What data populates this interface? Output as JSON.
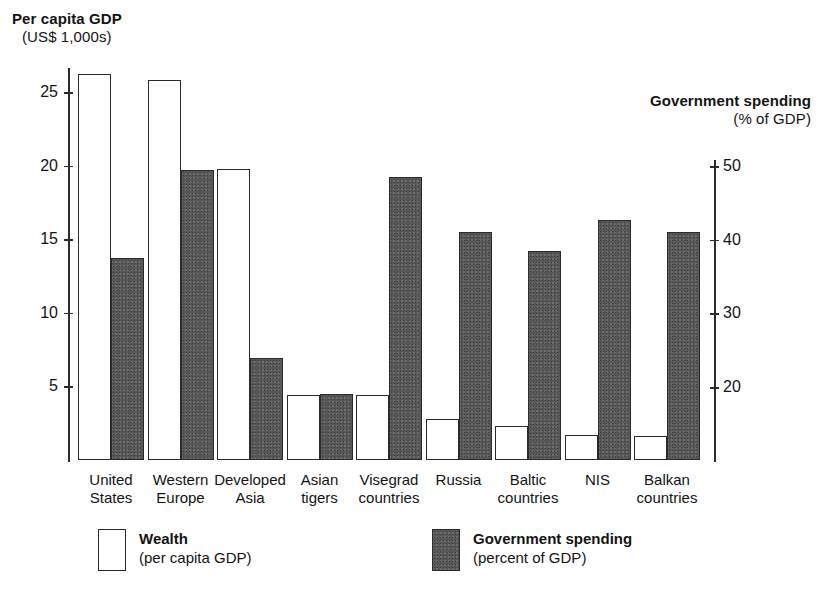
{
  "chart_data": {
    "type": "bar",
    "title": "",
    "categories": [
      "United States",
      "Western Europe",
      "Developed Asia",
      "Asian tigers",
      "Visegrad countries",
      "Russia",
      "Baltic countries",
      "NIS",
      "Balkan countries"
    ],
    "category_lines": [
      [
        "United",
        "States"
      ],
      [
        "Western",
        "Europe"
      ],
      [
        "Developed",
        "Asia"
      ],
      [
        "Asian",
        "tigers"
      ],
      [
        "Visegrad",
        "countries"
      ],
      [
        "Russia",
        ""
      ],
      [
        "Baltic",
        "countries"
      ],
      [
        "NIS",
        ""
      ],
      [
        "Balkan",
        "countries"
      ]
    ],
    "series": [
      {
        "name": "Wealth",
        "axis": "left",
        "unit": "US$ 1,000s",
        "values": [
          26.2,
          25.8,
          19.8,
          4.4,
          4.4,
          2.8,
          2.3,
          1.7,
          1.6
        ]
      },
      {
        "name": "Government spending",
        "axis": "right",
        "unit": "% of GDP",
        "values": [
          37.5,
          49.5,
          24.0,
          19.0,
          48.5,
          41.0,
          38.5,
          42.7,
          41.0
        ]
      }
    ],
    "left_axis": {
      "label_bold": "Per capita GDP",
      "label_sub": "(US$ 1,000s)",
      "ticks": [
        5,
        10,
        15,
        20,
        25
      ],
      "ylim": [
        0,
        26.8
      ]
    },
    "right_axis": {
      "label_bold": "Government spending",
      "label_sub": "(% of GDP)",
      "ticks": [
        20,
        30,
        40,
        50
      ],
      "ylim": [
        12.5,
        52.5
      ]
    },
    "grid": false,
    "legend_position": "bottom",
    "legend": [
      {
        "swatch": "white-outline",
        "title": "Wealth",
        "subtitle": "(per capita GDP)"
      },
      {
        "swatch": "dark-gray-fill",
        "title": "Government spending",
        "subtitle": "(percent of GDP)"
      }
    ]
  },
  "colors": {
    "background": "#ffffff",
    "ink": "#2b2b2b",
    "wealth_fill": "#ffffff",
    "spending_fill": "#575757"
  }
}
